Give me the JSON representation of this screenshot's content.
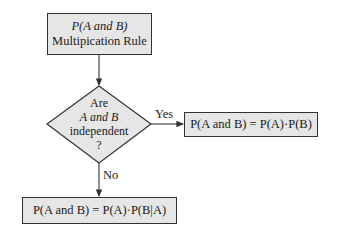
{
  "flowchart": {
    "start_box": {
      "line1": "P(A and B)",
      "line2": "Multipication Rule"
    },
    "decision": {
      "line1": "Are",
      "line2": "A and B",
      "line3": "independent",
      "line4": "?"
    },
    "yes_label": "Yes",
    "no_label": "No",
    "yes_result": "P(A and B) = P(A)·P(B)",
    "no_result": "P(A and B) = P(A)·P(B|A)",
    "colors": {
      "box_fill": "#e6e6e6",
      "stroke": "#333333"
    }
  }
}
